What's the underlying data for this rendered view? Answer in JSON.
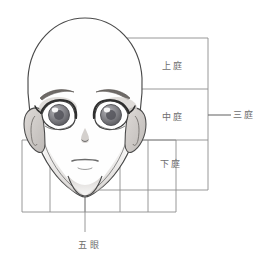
{
  "diagram": {
    "style": "pencil-sketch-grayscale",
    "canvas": {
      "width": 271,
      "height": 266,
      "background": "#ffffff"
    }
  },
  "labels": {
    "upper_third": "上庭",
    "middle_third": "中庭",
    "lower_third": "下庭",
    "three_courts": "三庭",
    "five_eyes": "五眼"
  },
  "panel": {
    "left": 85,
    "right": 208,
    "rows": [
      {
        "name": "upper_third",
        "top": 38,
        "bottom": 89
      },
      {
        "name": "middle_third",
        "top": 89,
        "bottom": 140
      },
      {
        "name": "lower_third",
        "top": 140,
        "bottom": 190
      }
    ]
  },
  "grid": {
    "vertical_lines_x": [
      22,
      50,
      85,
      120,
      148,
      176
    ],
    "column_count": 5,
    "columns_top": 140,
    "columns_bottom": 212,
    "center_axis_x": 85,
    "center_axis_top": 28,
    "center_axis_bottom": 232
  },
  "leaders": {
    "three_courts": {
      "x1": 208,
      "x2": 231,
      "y": 115
    },
    "five_eyes": {
      "x": 85,
      "y1": 212,
      "y2": 235
    }
  },
  "colors": {
    "outline": "#4a4a4a",
    "grid_line": "#8c8c8c",
    "text": "#6d6d6d",
    "skin_shadow": "#d9d5d2",
    "iris": "#8f8f93",
    "iris_dark": "#5c5c60",
    "lash": "#3d3d3d",
    "brow": "#707070",
    "ear_shade": "#c9c5c2"
  },
  "features": {
    "head_top_y": 18,
    "chin_y": 196,
    "brow_line_y": 89,
    "nose_base_y": 140,
    "eye_centers": [
      {
        "side": "left",
        "cx": 58,
        "cy": 114
      },
      {
        "side": "right",
        "cx": 118,
        "cy": 114
      }
    ],
    "mouth_y": 162,
    "nose_tip_y": 138
  }
}
